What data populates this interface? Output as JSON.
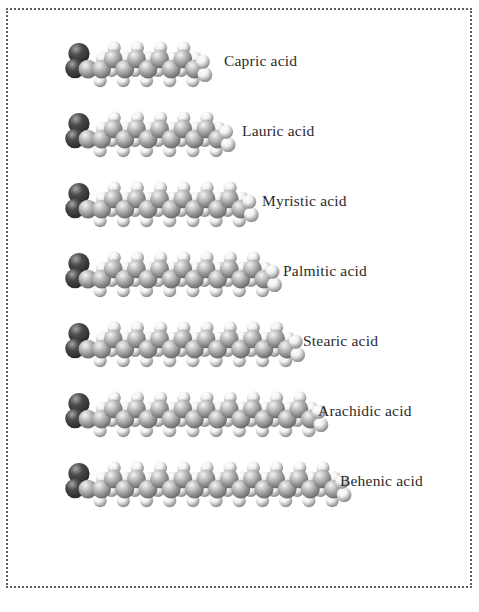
{
  "figure": {
    "background_color": "#ffffff",
    "border": {
      "style": "dotted",
      "color": "#5e5e5e",
      "width_px": 2
    },
    "label_color": "#2b2b2b",
    "atom_colors": {
      "oxygen": "#4a4a4a",
      "carbon": "#b9b9b9",
      "hydrogen": "#f2f2f2"
    }
  },
  "molecules": [
    {
      "label": "Capric acid",
      "carbon_chain_length": 10,
      "carbon_units": 9,
      "row_top": 33,
      "model_left": 64,
      "label_left": 224,
      "label_top": 53
    },
    {
      "label": "Lauric acid",
      "carbon_chain_length": 12,
      "carbon_units": 11,
      "row_top": 103,
      "model_left": 64,
      "label_left": 242,
      "label_top": 123
    },
    {
      "label": "Myristic acid",
      "carbon_chain_length": 14,
      "carbon_units": 13,
      "row_top": 173,
      "model_left": 64,
      "label_left": 262,
      "label_top": 193
    },
    {
      "label": "Palmitic acid",
      "carbon_chain_length": 16,
      "carbon_units": 15,
      "row_top": 243,
      "model_left": 64,
      "label_left": 283,
      "label_top": 263
    },
    {
      "label": "Stearic acid",
      "carbon_chain_length": 18,
      "carbon_units": 17,
      "row_top": 313,
      "model_left": 64,
      "label_left": 303,
      "label_top": 333
    },
    {
      "label": "Arachidic acid",
      "carbon_chain_length": 20,
      "carbon_units": 19,
      "row_top": 383,
      "model_left": 64,
      "label_left": 318,
      "label_top": 403
    },
    {
      "label": "Behenic acid",
      "carbon_chain_length": 22,
      "carbon_units": 21,
      "row_top": 453,
      "model_left": 64,
      "label_left": 340,
      "label_top": 473
    }
  ]
}
